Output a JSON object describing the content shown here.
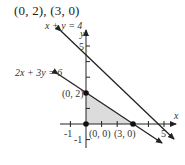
{
  "title": "(0, 2), (3, 0)",
  "graph": {
    "axes": {
      "x_label": "x",
      "y_label": "y",
      "x_ticks": [
        "-1",
        "5"
      ],
      "y_ticks": [
        "5",
        "-1"
      ]
    },
    "lines": [
      {
        "equation": "x + y = 4",
        "label": "x + y = 4"
      },
      {
        "equation": "2x + 3y = 6",
        "label": "2x + 3y = 6"
      }
    ],
    "points": [
      {
        "label": "(0, 2)",
        "x": 0,
        "y": 2
      },
      {
        "label": "(0, 0)",
        "x": 0,
        "y": 0
      },
      {
        "label": "(3, 0)",
        "x": 3,
        "y": 0
      }
    ],
    "shaded_region": "triangle (0,0), (0,2), (3,0)",
    "colors": {
      "shade": "#dcdcdc",
      "line": "#222222"
    }
  }
}
